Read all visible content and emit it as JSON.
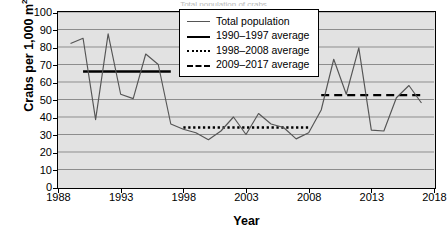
{
  "title": "Total population of crabs",
  "axis": {
    "ylabel_main": "Crabs per 1,000 m",
    "ylabel_sup": "2",
    "xlabel": "Year",
    "yticks": [
      "100",
      "90",
      "80",
      "70",
      "60",
      "50",
      "40",
      "30",
      "20",
      "10",
      "0"
    ],
    "xticks": [
      "1988",
      "1993",
      "1998",
      "2003",
      "2008",
      "2013",
      "2018"
    ]
  },
  "legend": {
    "items": [
      {
        "label": "Total population",
        "key": "line-thin-gray"
      },
      {
        "label": "1990–1997 average",
        "key": "line-thick-solid"
      },
      {
        "label": "1998–2008 average",
        "key": "line-dotted"
      },
      {
        "label": "2009–2017 average",
        "key": "line-dashed"
      }
    ]
  },
  "colors": {
    "plot_background": "#e2e2e2",
    "gridline": "#8d8d8d",
    "series_line": "#555555",
    "average_line": "#000000",
    "axis": "#000000",
    "page_background": "#ffffff"
  },
  "chart_data": {
    "type": "line",
    "title": "Total population of crabs",
    "xlabel": "Year",
    "ylabel": "Crabs per 1,000 m2",
    "xlim": [
      1988,
      2018
    ],
    "ylim": [
      0,
      100
    ],
    "ytick_interval": 10,
    "xtick_interval": 5,
    "grid": true,
    "legend_position": "top-center-inside",
    "series": [
      {
        "name": "Total population",
        "style": "solid-thin",
        "x": [
          1989,
          1990,
          1991,
          1992,
          1993,
          1994,
          1995,
          1996,
          1997,
          1998,
          1999,
          2000,
          2001,
          2002,
          2003,
          2004,
          2005,
          2006,
          2007,
          2008,
          2009,
          2010,
          2011,
          2012,
          2013,
          2014,
          2015,
          2016,
          2017
        ],
        "values": [
          82,
          85,
          38.5,
          87.5,
          53,
          50.5,
          76,
          70,
          36,
          33,
          31,
          27,
          32,
          40,
          30,
          42,
          36,
          34,
          27.5,
          31,
          44,
          73,
          53,
          79.5,
          32.5,
          32,
          51,
          58,
          48
        ]
      },
      {
        "name": "1990–1997 average",
        "style": "solid-thick",
        "x_range": [
          1990,
          1997
        ],
        "value": 66
      },
      {
        "name": "1998–2008 average",
        "style": "dotted",
        "x_range": [
          1998,
          2008
        ],
        "value": 34
      },
      {
        "name": "2009–2017 average",
        "style": "dashed",
        "x_range": [
          2009,
          2017
        ],
        "value": 52.5
      }
    ]
  }
}
